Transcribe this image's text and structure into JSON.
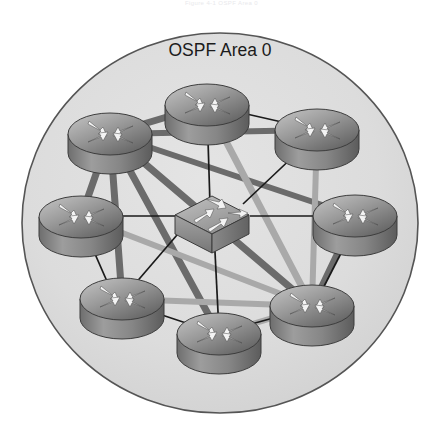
{
  "figure": {
    "caption": "Figure 4-1 OSPF Area 0",
    "area_label": "OSPF Area 0"
  },
  "colors": {
    "page_background": "#ffffff",
    "area_fill": "#dcdcdc",
    "area_stroke": "#4a4a4a",
    "serial_link_dark": "#6b6b6b",
    "serial_link_light": "#a9a9a9",
    "ethernet_link": "#1a1a1a",
    "device_top_light": "#b9b9b9",
    "device_top_dark": "#5a5a5a",
    "device_body": "#8e8e8e",
    "device_outline": "#3d3d3d",
    "arrow_fill": "#f3f3f3"
  },
  "topology": {
    "area": {
      "cx": 220,
      "cy": 223,
      "rx": 198,
      "ry": 190
    },
    "devices": [
      {
        "id": "r-top",
        "name": "router-top",
        "type": "router",
        "x": 207,
        "y": 105,
        "rx": 42,
        "ry": 21,
        "h": 19
      },
      {
        "id": "r-top-left",
        "name": "router-top-left",
        "type": "router",
        "x": 110,
        "y": 134,
        "rx": 42,
        "ry": 21,
        "h": 19
      },
      {
        "id": "r-top-right",
        "name": "router-top-right",
        "type": "router",
        "x": 317,
        "y": 130,
        "rx": 42,
        "ry": 21,
        "h": 19
      },
      {
        "id": "r-left",
        "name": "router-left",
        "type": "router",
        "x": 81,
        "y": 217,
        "rx": 42,
        "ry": 21,
        "h": 19
      },
      {
        "id": "r-right",
        "name": "router-right",
        "type": "router",
        "x": 355,
        "y": 216,
        "rx": 42,
        "ry": 21,
        "h": 19
      },
      {
        "id": "r-bottom-left",
        "name": "router-bottom-left",
        "type": "router",
        "x": 122,
        "y": 299,
        "rx": 42,
        "ry": 21,
        "h": 19
      },
      {
        "id": "r-bottom",
        "name": "router-bottom",
        "type": "router",
        "x": 219,
        "y": 334,
        "rx": 42,
        "ry": 21,
        "h": 19
      },
      {
        "id": "r-bottom-right",
        "name": "router-bottom-right",
        "type": "router",
        "x": 312,
        "y": 306,
        "rx": 42,
        "ry": 21,
        "h": 19
      },
      {
        "id": "sw-center",
        "name": "switch-center",
        "type": "switch",
        "x": 212,
        "y": 215,
        "w": 74,
        "d": 34,
        "h": 20
      }
    ],
    "links": [
      {
        "from": "r-top-left",
        "to": "r-top",
        "kind": "serial",
        "weight": 7
      },
      {
        "from": "r-top-left",
        "to": "r-top-right",
        "kind": "serial",
        "weight": 6
      },
      {
        "from": "r-top-left",
        "to": "r-left",
        "kind": "serial",
        "weight": 7
      },
      {
        "from": "r-top-left",
        "to": "r-bottom-left",
        "kind": "serial",
        "weight": 7
      },
      {
        "from": "r-top-left",
        "to": "r-bottom",
        "kind": "serial",
        "weight": 7
      },
      {
        "from": "r-top-left",
        "to": "r-bottom-right",
        "kind": "serial",
        "weight": 7
      },
      {
        "from": "r-top-left",
        "to": "r-right",
        "kind": "serial",
        "weight": 6
      },
      {
        "from": "r-top",
        "to": "r-bottom-right",
        "kind": "serial-l",
        "weight": 7
      },
      {
        "from": "r-top-right",
        "to": "r-bottom-right",
        "kind": "serial-l",
        "weight": 6
      },
      {
        "from": "r-left",
        "to": "r-bottom-right",
        "kind": "serial-l",
        "weight": 6
      },
      {
        "from": "r-bottom-left",
        "to": "r-bottom-right",
        "kind": "serial-l",
        "weight": 6
      },
      {
        "from": "r-bottom",
        "to": "r-bottom-right",
        "kind": "serial-l",
        "weight": 6
      },
      {
        "from": "r-right",
        "to": "r-bottom-right",
        "kind": "serial",
        "weight": 6
      },
      {
        "from": "r-top",
        "to": "r-top-right",
        "kind": "ethernet",
        "weight": 2
      },
      {
        "from": "r-top",
        "to": "sw-center",
        "kind": "ethernet",
        "weight": 2
      },
      {
        "from": "r-top-right",
        "to": "sw-center",
        "kind": "ethernet",
        "weight": 2
      },
      {
        "from": "r-left",
        "to": "sw-center",
        "kind": "ethernet",
        "weight": 2
      },
      {
        "from": "r-right",
        "to": "sw-center",
        "kind": "ethernet",
        "weight": 2
      },
      {
        "from": "r-bottom",
        "to": "sw-center",
        "kind": "ethernet",
        "weight": 2
      },
      {
        "from": "sw-center",
        "to": "r-bottom-left",
        "kind": "ethernet",
        "weight": 2
      },
      {
        "from": "r-left",
        "to": "r-bottom-left",
        "kind": "ethernet",
        "weight": 2
      },
      {
        "from": "r-bottom-left",
        "to": "r-bottom",
        "kind": "ethernet",
        "weight": 2
      },
      {
        "from": "r-bottom",
        "to": "r-bottom-right",
        "kind": "ethernet",
        "weight": 2
      },
      {
        "from": "r-right",
        "to": "r-bottom-right",
        "kind": "ethernet",
        "weight": 2
      }
    ]
  }
}
